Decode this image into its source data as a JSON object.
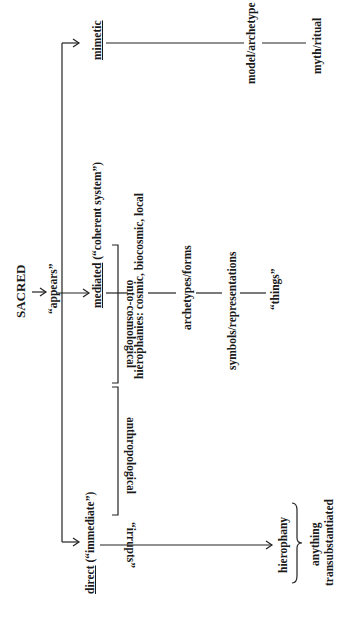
{
  "diagram": {
    "root": {
      "label": "SACRED",
      "verb": "“appears”"
    },
    "branches": {
      "mimetic": {
        "label": "mimetic",
        "chain": [
          "model/archetype",
          "myth/ritual"
        ]
      },
      "mediated": {
        "label": "mediated",
        "note": "(“coherent system”)",
        "chain": [
          "hierophanies: cosmic, biocosmic, local",
          "archetypes/forms",
          "symbols/representations",
          "“things”"
        ],
        "groups": [
          {
            "label": "onto-cosmological",
            "covers": [
              "hierophanies: cosmic, biocosmic, local",
              "archetypes/forms"
            ]
          },
          {
            "label": "anthropological",
            "covers": [
              "symbols/representations",
              "“things”"
            ]
          }
        ]
      },
      "direct": {
        "label": "direct",
        "note": "(“immediate”)",
        "arrow_label": "“irrupts”",
        "target": "hierophany",
        "brace_note_line1": "anything",
        "brace_note_line2": "transubstantiated"
      }
    },
    "colors": {
      "ink": "#1a1a1a",
      "background": "#ffffff"
    }
  }
}
